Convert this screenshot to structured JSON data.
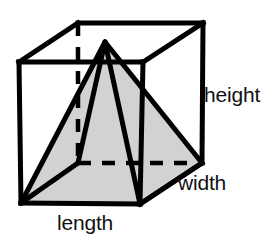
{
  "figure": {
    "background_color": "#ffffff",
    "stroke_color": "#000000",
    "pyramid_fill_color": "#d2d2d2",
    "labels": {
      "height": "height",
      "width": "width",
      "length": "length"
    },
    "geometry": {
      "cube": {
        "front_top_left": [
          19,
          62
        ],
        "front_top_right": [
          143,
          62
        ],
        "front_bottom_right": [
          140,
          204
        ],
        "front_bottom_left": [
          21,
          203
        ],
        "back_top_left": [
          78,
          23
        ],
        "back_top_right": [
          203,
          23
        ],
        "back_bottom_right": [
          202,
          163
        ],
        "back_bottom_left": [
          78,
          163
        ]
      },
      "pyramid": {
        "apex": [
          105,
          42
        ],
        "base_front_left": [
          21,
          203
        ],
        "base_front_right": [
          140,
          204
        ],
        "base_back_right": [
          202,
          163
        ],
        "base_back_left": [
          78,
          163
        ]
      },
      "hidden_edges": [
        [
          [
            78,
            23
          ],
          [
            78,
            163
          ]
        ],
        [
          [
            78,
            163
          ],
          [
            202,
            163
          ]
        ],
        [
          [
            78,
            163
          ],
          [
            21,
            203
          ]
        ]
      ]
    }
  }
}
